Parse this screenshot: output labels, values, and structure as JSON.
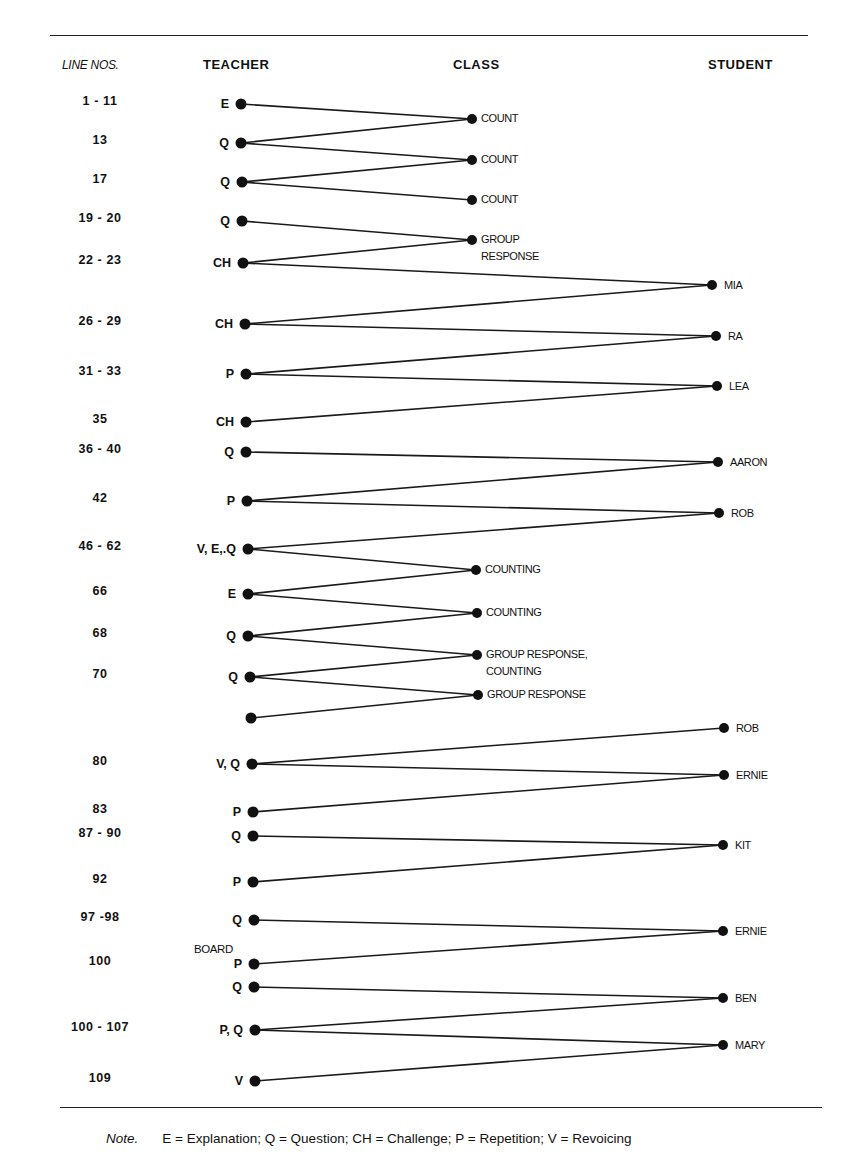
{
  "headers": {
    "line_nos": "LINE NOS.",
    "teacher": "TEACHER",
    "class": "CLASS",
    "student": "STUDENT"
  },
  "teacher_nodes": [
    {
      "id": "t1",
      "line": "1 - 11",
      "code": "E",
      "x": 241,
      "y": 104
    },
    {
      "id": "t2",
      "line": "13",
      "code": "Q",
      "x": 241,
      "y": 143
    },
    {
      "id": "t3",
      "line": "17",
      "code": "Q",
      "x": 242,
      "y": 182
    },
    {
      "id": "t4",
      "line": "19 - 20",
      "code": "Q",
      "x": 242,
      "y": 221
    },
    {
      "id": "t5",
      "line": "22 - 23",
      "code": "CH",
      "x": 243,
      "y": 263
    },
    {
      "id": "t6",
      "line": "26 - 29",
      "code": "CH",
      "x": 245,
      "y": 324
    },
    {
      "id": "t7",
      "line": "31 - 33",
      "code": "P",
      "x": 246,
      "y": 374
    },
    {
      "id": "t8",
      "line": "35",
      "code": "CH",
      "x": 246,
      "y": 422
    },
    {
      "id": "t9",
      "line": "36 - 40",
      "code": "Q",
      "x": 246,
      "y": 452
    },
    {
      "id": "t10",
      "line": "42",
      "code": "P",
      "x": 247,
      "y": 501
    },
    {
      "id": "t11",
      "line": "46 - 62",
      "code": "V, E,.Q",
      "x": 248,
      "y": 549
    },
    {
      "id": "t12",
      "line": "66",
      "code": "E",
      "x": 248,
      "y": 594
    },
    {
      "id": "t13",
      "line": "68",
      "code": "Q",
      "x": 248,
      "y": 636
    },
    {
      "id": "t14",
      "line": "70",
      "code": "Q",
      "x": 250,
      "y": 677
    },
    {
      "id": "t15",
      "line": "",
      "code": "",
      "x": 251,
      "y": 718
    },
    {
      "id": "t16",
      "line": "80",
      "code": "V, Q",
      "x": 252,
      "y": 764
    },
    {
      "id": "t17",
      "line": "83",
      "code": "P",
      "x": 253,
      "y": 812
    },
    {
      "id": "t18",
      "line": "87 - 90",
      "code": "Q",
      "x": 253,
      "y": 836
    },
    {
      "id": "t19",
      "line": "92",
      "code": "P",
      "x": 253,
      "y": 882
    },
    {
      "id": "t20",
      "line": "97 -98",
      "code": "Q",
      "x": 254,
      "y": 920
    },
    {
      "id": "t21",
      "line": "100",
      "code": "P",
      "x": 254,
      "y": 964,
      "extra": "BOARD"
    },
    {
      "id": "t22",
      "line": "",
      "code": "Q",
      "x": 254,
      "y": 987
    },
    {
      "id": "t23",
      "line": "100 - 107",
      "code": "P, Q",
      "x": 255,
      "y": 1030
    },
    {
      "id": "t24",
      "line": "109",
      "code": "V",
      "x": 255,
      "y": 1081
    }
  ],
  "class_nodes": [
    {
      "id": "c1",
      "label": [
        "COUNT"
      ],
      "x": 472,
      "y": 119
    },
    {
      "id": "c2",
      "label": [
        "COUNT"
      ],
      "x": 472,
      "y": 160
    },
    {
      "id": "c3",
      "label": [
        "COUNT"
      ],
      "x": 472,
      "y": 200
    },
    {
      "id": "c4",
      "label": [
        "GROUP",
        "RESPONSE"
      ],
      "x": 472,
      "y": 240
    },
    {
      "id": "c5",
      "label": [
        "COUNTING"
      ],
      "x": 476,
      "y": 570
    },
    {
      "id": "c6",
      "label": [
        "COUNTING"
      ],
      "x": 477,
      "y": 613
    },
    {
      "id": "c7",
      "label": [
        "GROUP RESPONSE,",
        "COUNTING"
      ],
      "x": 477,
      "y": 655
    },
    {
      "id": "c8",
      "label": [
        "GROUP RESPONSE"
      ],
      "x": 478,
      "y": 695
    }
  ],
  "student_nodes": [
    {
      "id": "s1",
      "label": "MIA",
      "x": 712,
      "y": 285
    },
    {
      "id": "s2",
      "label": "RA",
      "x": 716,
      "y": 336
    },
    {
      "id": "s3",
      "label": "LEA",
      "x": 717,
      "y": 386
    },
    {
      "id": "s4",
      "label": "AARON",
      "x": 718,
      "y": 462
    },
    {
      "id": "s5",
      "label": "ROB",
      "x": 719,
      "y": 513
    },
    {
      "id": "s6",
      "label": "ROB",
      "x": 724,
      "y": 728
    },
    {
      "id": "s7",
      "label": "ERNIE",
      "x": 724,
      "y": 775
    },
    {
      "id": "s8",
      "label": "KIT",
      "x": 723,
      "y": 845
    },
    {
      "id": "s9",
      "label": "ERNIE",
      "x": 723,
      "y": 931
    },
    {
      "id": "s10",
      "label": "BEN",
      "x": 723,
      "y": 998
    },
    {
      "id": "s11",
      "label": "MARY",
      "x": 723,
      "y": 1045
    }
  ],
  "edges": [
    [
      "t1",
      "c1"
    ],
    [
      "t2",
      "c1"
    ],
    [
      "t2",
      "c2"
    ],
    [
      "t3",
      "c2"
    ],
    [
      "t3",
      "c3"
    ],
    [
      "t4",
      "c4"
    ],
    [
      "t5",
      "c4"
    ],
    [
      "t5",
      "s1"
    ],
    [
      "t6",
      "s1"
    ],
    [
      "t6",
      "s2"
    ],
    [
      "t7",
      "s2"
    ],
    [
      "t7",
      "s3"
    ],
    [
      "t8",
      "s3"
    ],
    [
      "t9",
      "s4"
    ],
    [
      "t10",
      "s4"
    ],
    [
      "t10",
      "s5"
    ],
    [
      "t11",
      "s5"
    ],
    [
      "t11",
      "c5"
    ],
    [
      "t12",
      "c5"
    ],
    [
      "t12",
      "c6"
    ],
    [
      "t13",
      "c6"
    ],
    [
      "t13",
      "c7"
    ],
    [
      "t14",
      "c7"
    ],
    [
      "t14",
      "c8"
    ],
    [
      "t15",
      "c8"
    ],
    [
      "t16",
      "s6"
    ],
    [
      "t16",
      "s7"
    ],
    [
      "t17",
      "s7"
    ],
    [
      "t18",
      "s8"
    ],
    [
      "t19",
      "s8"
    ],
    [
      "t20",
      "s9"
    ],
    [
      "t21",
      "s9"
    ],
    [
      "t22",
      "s10"
    ],
    [
      "t23",
      "s10"
    ],
    [
      "t23",
      "s11"
    ],
    [
      "t24",
      "s11"
    ]
  ],
  "note": {
    "lead": "Note.",
    "text": "E = Explanation;  Q = Question;  CH = Challenge;  P = Repetition;  V = Revoicing"
  }
}
